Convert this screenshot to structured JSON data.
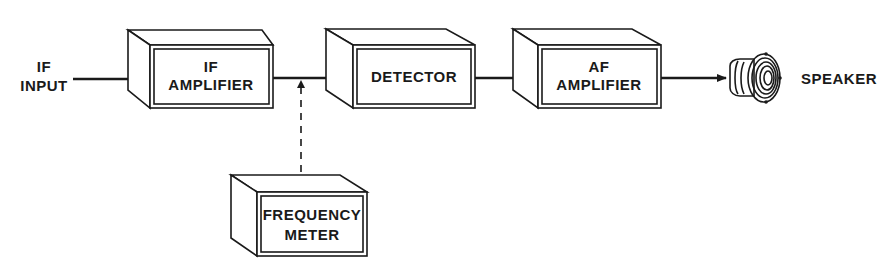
{
  "diagram": {
    "type": "block-diagram",
    "input": {
      "line1": "IF",
      "line2": "INPUT"
    },
    "blocks": [
      {
        "id": "if-amplifier",
        "line1": "IF",
        "line2": "AMPLIFIER"
      },
      {
        "id": "detector",
        "line1": "DETECTOR",
        "line2": ""
      },
      {
        "id": "af-amplifier",
        "line1": "AF",
        "line2": "AMPLIFIER"
      },
      {
        "id": "frequency-meter",
        "line1": "FREQUENCY",
        "line2": "METER"
      }
    ],
    "output": {
      "label": "SPEAKER"
    },
    "connections": [
      {
        "from": "IF INPUT",
        "to": "IF AMPLIFIER",
        "style": "solid-arrow"
      },
      {
        "from": "IF AMPLIFIER",
        "to": "DETECTOR",
        "style": "solid-arrow"
      },
      {
        "from": "FREQUENCY METER",
        "to": "IF AMPLIFIER-DETECTOR line",
        "style": "dashed-arrow"
      },
      {
        "from": "DETECTOR",
        "to": "AF AMPLIFIER",
        "style": "solid-arrow"
      },
      {
        "from": "AF AMPLIFIER",
        "to": "SPEAKER",
        "style": "solid-arrow"
      }
    ]
  }
}
